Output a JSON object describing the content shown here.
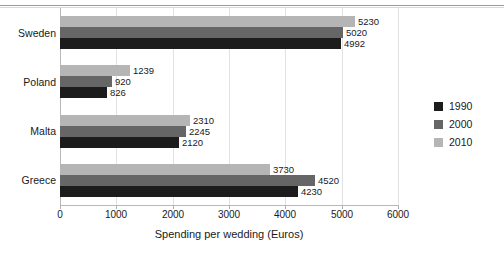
{
  "chart_data": {
    "type": "bar",
    "orientation": "horizontal",
    "title": "",
    "xlabel": "Spending per wedding (Euros)",
    "ylabel": "",
    "categories": [
      "Sweden",
      "Poland",
      "Malta",
      "Greece"
    ],
    "xlim": [
      0,
      6000
    ],
    "xticks": [
      0,
      1000,
      2000,
      3000,
      4000,
      5000,
      6000
    ],
    "xtick_labels": [
      "0",
      "1000",
      "2000",
      "3000",
      "4000",
      "5000",
      "6000"
    ],
    "grid": true,
    "legend_position": "right",
    "series": [
      {
        "name": "1990",
        "color": "#1c1c1c",
        "values": [
          4992,
          826,
          2120,
          4230
        ],
        "value_labels": [
          "4992",
          "826",
          "2120",
          "4230"
        ]
      },
      {
        "name": "2000",
        "color": "#666666",
        "values": [
          5020,
          920,
          2245,
          4520
        ],
        "value_labels": [
          "5020",
          "920",
          "2245",
          "4520"
        ]
      },
      {
        "name": "2010",
        "color": "#b5b5b5",
        "values": [
          5230,
          1239,
          2310,
          3730
        ],
        "value_labels": [
          "5230",
          "1239",
          "2310",
          "3730"
        ]
      }
    ]
  },
  "legend": {
    "entries": [
      {
        "label": "1990",
        "color": "#1c1c1c"
      },
      {
        "label": "2000",
        "color": "#666666"
      },
      {
        "label": "2010",
        "color": "#b5b5b5"
      }
    ]
  },
  "axis": {
    "x_title": "Spending per wedding (Euros)"
  }
}
